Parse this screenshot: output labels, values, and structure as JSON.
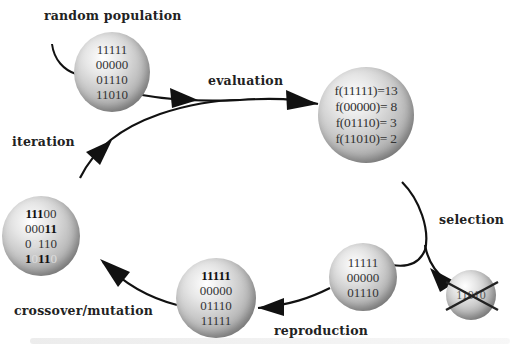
{
  "diagram": {
    "type": "genetic-algorithm-cycle",
    "labels": {
      "random_population": "random population",
      "evaluation": "evaluation",
      "selection": "selection",
      "reproduction": "reproduction",
      "crossover_mutation": "crossover/mutation",
      "iteration": "iteration"
    },
    "nodes": {
      "initial_population": {
        "lines": [
          "11111",
          "00000",
          "01110",
          "11010"
        ]
      },
      "evaluated_population": {
        "lines": [
          "f(11111)=13",
          "f(00000)= 8",
          "f(01110)= 3",
          "f(11010)= 2"
        ]
      },
      "selected_population": {
        "lines": [
          "11111",
          "00000",
          "01110"
        ]
      },
      "discarded_individual": {
        "lines": [
          "11010"
        ],
        "crossed_out": true
      },
      "reproduced_population": {
        "lines": [
          "11111",
          "00000",
          "01110",
          "11111"
        ]
      },
      "offspring_population": {
        "lines": [
          {
            "bold": "111",
            "normal": "00"
          },
          {
            "normal": "000",
            "bold": "11"
          },
          {
            "normal": "0",
            "faded": "0",
            "normal2": "110"
          },
          {
            "bold": "1",
            "faded": "0",
            "bold2": "11",
            "faded2": "0"
          }
        ]
      }
    },
    "edges": [
      {
        "from": "start",
        "to": "initial_population"
      },
      {
        "from": "initial_population",
        "to": "evaluated_population",
        "label": "evaluation"
      },
      {
        "from": "evaluated_population",
        "to": "selected_population",
        "label": "selection"
      },
      {
        "from": "evaluated_population",
        "to": "discarded_individual",
        "label": "selection"
      },
      {
        "from": "selected_population",
        "to": "reproduced_population",
        "label": "reproduction"
      },
      {
        "from": "reproduced_population",
        "to": "offspring_population",
        "label": "crossover/mutation"
      },
      {
        "from": "offspring_population",
        "to": "evaluated_population",
        "label": "iteration"
      }
    ],
    "colors": {
      "arrow": "#111111",
      "text": "#222222",
      "sphere_light": "#ffffff",
      "sphere_dark": "#7c7c7c"
    }
  }
}
